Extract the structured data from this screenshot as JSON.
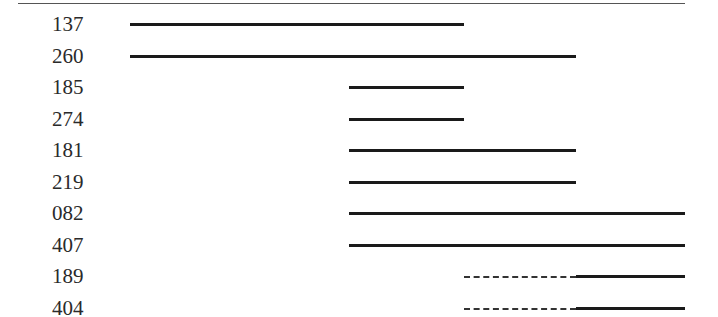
{
  "chart_data": {
    "type": "table",
    "x_axis": {
      "ticks_shown": false,
      "units": "relative column position",
      "columns": [
        "A",
        "B",
        "C",
        "D"
      ]
    },
    "rows": [
      {
        "label": "137",
        "segments": [
          {
            "start": 0,
            "end": 2,
            "style": "solid"
          }
        ]
      },
      {
        "label": "260",
        "segments": [
          {
            "start": 0,
            "end": 3,
            "style": "solid"
          }
        ]
      },
      {
        "label": "185",
        "segments": [
          {
            "start": 1,
            "end": 2,
            "style": "solid"
          }
        ]
      },
      {
        "label": "274",
        "segments": [
          {
            "start": 1,
            "end": 2,
            "style": "solid"
          }
        ]
      },
      {
        "label": "181",
        "segments": [
          {
            "start": 1,
            "end": 3,
            "style": "solid"
          }
        ]
      },
      {
        "label": "219",
        "segments": [
          {
            "start": 1,
            "end": 3,
            "style": "solid"
          }
        ]
      },
      {
        "label": "082",
        "segments": [
          {
            "start": 1,
            "end": 4,
            "style": "solid"
          }
        ]
      },
      {
        "label": "407",
        "segments": [
          {
            "start": 1,
            "end": 4,
            "style": "solid"
          }
        ]
      },
      {
        "label": "189",
        "segments": [
          {
            "start": 2,
            "end": 3,
            "style": "dashed"
          },
          {
            "start": 3,
            "end": 4,
            "style": "solid"
          }
        ]
      },
      {
        "label": "404",
        "segments": [
          {
            "start": 2,
            "end": 3,
            "style": "dashed"
          },
          {
            "start": 3,
            "end": 4,
            "style": "solid"
          }
        ]
      }
    ],
    "column_x_px": [
      130,
      349,
      464,
      576,
      685
    ],
    "title": "",
    "xlabel": "",
    "ylabel": "",
    "grid": false,
    "legend": null
  },
  "colors": {
    "line": "#1a1a1a",
    "rule": "#555555",
    "text": "#2a2a2a"
  }
}
